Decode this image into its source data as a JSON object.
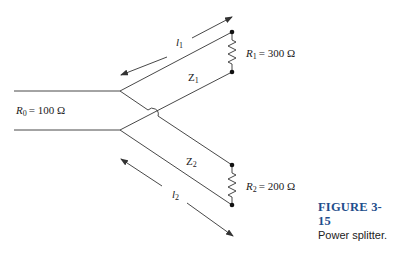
{
  "figure": {
    "number": "FIGURE 3-15",
    "caption": "Power splitter."
  },
  "source": {
    "resistor_symbol": "R",
    "resistor_subscript": "0",
    "value": "= 100 Ω"
  },
  "branch1": {
    "length_symbol": "l",
    "length_subscript": "1",
    "impedance_symbol": "Z",
    "impedance_subscript": "1",
    "load_symbol": "R",
    "load_subscript": "1",
    "load_value": "= 300 Ω"
  },
  "branch2": {
    "length_symbol": "l",
    "length_subscript": "2",
    "impedance_symbol": "Z",
    "impedance_subscript": "2",
    "load_symbol": "R",
    "load_subscript": "2",
    "load_value": "= 200 Ω"
  },
  "colors": {
    "line": "#333333",
    "caption_title": "#1f4e8c"
  }
}
